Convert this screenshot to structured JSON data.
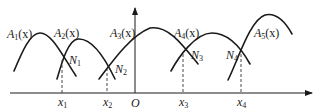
{
  "diagram": {
    "origin_label": "O",
    "curves": [
      {
        "name": "A",
        "index": "1",
        "arg": "(x)"
      },
      {
        "name": "A",
        "index": "2",
        "arg": "(x)"
      },
      {
        "name": "A",
        "index": "3",
        "arg": "(x)"
      },
      {
        "name": "A",
        "index": "4",
        "arg": "(x)"
      },
      {
        "name": "A",
        "index": "5",
        "arg": "(x)"
      }
    ],
    "intersections": [
      {
        "name": "N",
        "index": "1"
      },
      {
        "name": "N",
        "index": "2"
      },
      {
        "name": "N",
        "index": "3"
      },
      {
        "name": "N",
        "index": "4"
      }
    ],
    "x_ticks": [
      {
        "name": "x",
        "index": "1"
      },
      {
        "name": "x",
        "index": "2"
      },
      {
        "name": "x",
        "index": "3"
      },
      {
        "name": "x",
        "index": "4"
      }
    ]
  }
}
